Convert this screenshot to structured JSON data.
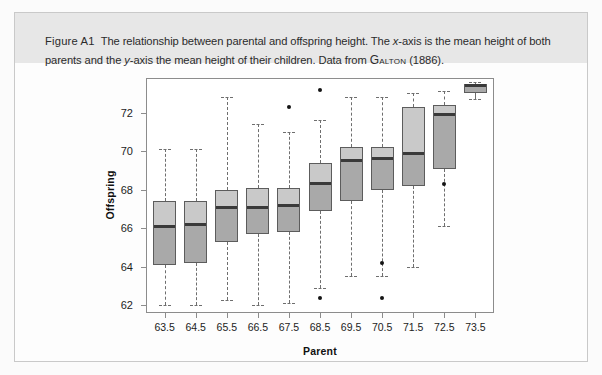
{
  "figure": {
    "label": "Figure A1",
    "caption_part1": "The relationship between parental and offspring height. The ",
    "caption_xaxis_italic": "x",
    "caption_part2": "-axis is the mean height of both parents and the ",
    "caption_yaxis_italic": "y",
    "caption_part3": "-axis the mean height of their children. Data from ",
    "caption_source": "Galton",
    "caption_part4": " (1886).",
    "caption_full": "Figure A1  The relationship between parental and offspring height. The x-axis is the mean height of both parents and the y-axis the mean height of their children. Data from GALTON (1886)."
  },
  "colors": {
    "caption_band": "#e7e7e7",
    "box_upper": "#c9c9c9",
    "box_lower": "#a9a9a9",
    "median_line": "#3a3a3a",
    "box_border": "#5c5c5c",
    "whisker": "#6e6e6e",
    "outlier": "#141414",
    "axis": "#8c8c8c"
  },
  "chart_data": {
    "type": "box",
    "title": "",
    "xlabel": "Parent",
    "ylabel": "Offspring",
    "xlim": [
      62.9,
      74.1
    ],
    "ylim": [
      61.6,
      73.8
    ],
    "ytick_labels": [
      "62",
      "64",
      "66",
      "68",
      "70",
      "72"
    ],
    "ytick_values": [
      62,
      64,
      66,
      68,
      70,
      72
    ],
    "xtick_labels": [
      "63.5",
      "64.5",
      "65.5",
      "66.5",
      "67.5",
      "68.5",
      "69.5",
      "70.5",
      "71.5",
      "72.5",
      "73.5"
    ],
    "categories": [
      63.5,
      64.5,
      65.5,
      66.5,
      67.5,
      68.5,
      69.5,
      70.5,
      71.5,
      72.5,
      73.5
    ],
    "grid": false,
    "legend": "none",
    "boxes": [
      {
        "category": "63.5",
        "whisker_low": 62.0,
        "q1": 64.1,
        "median": 66.1,
        "q3": 67.4,
        "whisker_high": 70.1,
        "outliers": []
      },
      {
        "category": "64.5",
        "whisker_low": 62.0,
        "q1": 64.2,
        "median": 66.2,
        "q3": 67.4,
        "whisker_high": 70.1,
        "outliers": []
      },
      {
        "category": "65.5",
        "whisker_low": 62.3,
        "q1": 65.3,
        "median": 67.1,
        "q3": 68.0,
        "whisker_high": 72.8,
        "outliers": []
      },
      {
        "category": "66.5",
        "whisker_low": 62.0,
        "q1": 65.7,
        "median": 67.1,
        "q3": 68.1,
        "whisker_high": 71.4,
        "outliers": []
      },
      {
        "category": "67.5",
        "whisker_low": 62.1,
        "q1": 65.8,
        "median": 67.2,
        "q3": 68.1,
        "whisker_high": 71.0,
        "outliers": [
          72.3
        ]
      },
      {
        "category": "68.5",
        "whisker_low": 62.9,
        "q1": 66.9,
        "median": 68.3,
        "q3": 69.4,
        "whisker_high": 71.6,
        "outliers": [
          73.2,
          62.4
        ]
      },
      {
        "category": "69.5",
        "whisker_low": 63.5,
        "q1": 67.4,
        "median": 69.5,
        "q3": 70.2,
        "whisker_high": 72.8,
        "outliers": []
      },
      {
        "category": "70.5",
        "whisker_low": 63.5,
        "q1": 68.0,
        "median": 69.6,
        "q3": 70.2,
        "whisker_high": 72.8,
        "outliers": [
          64.2,
          62.4
        ]
      },
      {
        "category": "71.5",
        "whisker_low": 64.0,
        "q1": 68.2,
        "median": 69.9,
        "q3": 72.3,
        "whisker_high": 73.0,
        "outliers": []
      },
      {
        "category": "72.5",
        "whisker_low": 66.1,
        "q1": 69.1,
        "median": 71.9,
        "q3": 72.4,
        "whisker_high": 73.1,
        "outliers": [
          68.3
        ]
      },
      {
        "category": "73.5",
        "whisker_low": 72.7,
        "q1": 73.0,
        "median": 73.4,
        "q3": 73.5,
        "whisker_high": 73.6,
        "outliers": []
      }
    ]
  }
}
